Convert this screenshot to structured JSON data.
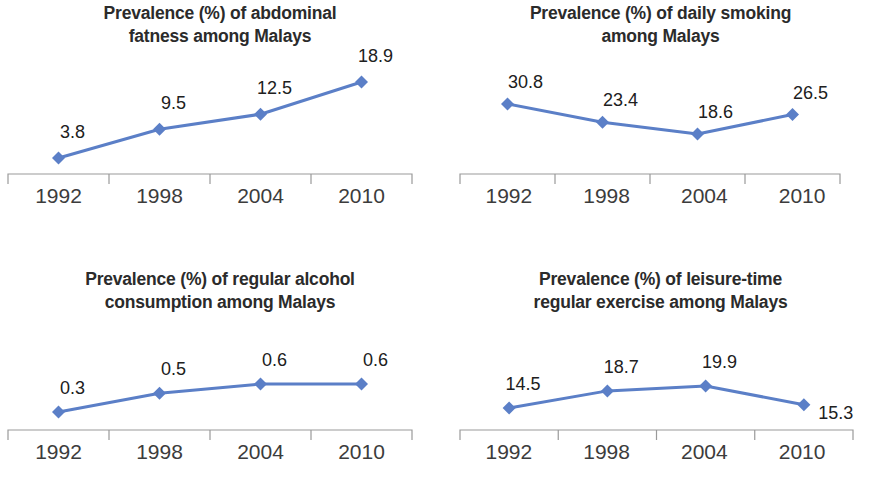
{
  "figure": {
    "background_color": "#ffffff",
    "series_color": "#5B7FC7",
    "axis_color": "#9a9a9a",
    "text_color": "#262626",
    "panel_count": 4
  },
  "chart_data": [
    {
      "type": "line",
      "title": "Prevalence (%) of abdominal\nfatness among Malays",
      "title_line1": "Prevalence (%) of abdominal",
      "title_line2": "fatness among Malays",
      "categories": [
        "1992",
        "1998",
        "2004",
        "2010"
      ],
      "values": [
        3.8,
        9.5,
        12.5,
        18.9
      ],
      "labels": [
        "3.8",
        "9.5",
        "12.5",
        "18.9"
      ],
      "xlabel": "",
      "ylabel": "",
      "ylim": [
        0,
        21
      ],
      "grid": false,
      "legend": "none",
      "marker": "diamond",
      "series_name": "Prevalence (%)"
    },
    {
      "type": "line",
      "title": "Prevalence (%) of daily smoking\namong Malays",
      "title_line1": "Prevalence (%) of daily smoking",
      "title_line2": "among Malays",
      "categories": [
        "1992",
        "1998",
        "2004",
        "2010"
      ],
      "values": [
        30.8,
        23.4,
        18.6,
        26.5
      ],
      "labels": [
        "30.8",
        "23.4",
        "18.6",
        "26.5"
      ],
      "xlabel": "",
      "ylabel": "",
      "ylim": [
        0,
        34
      ],
      "grid": false,
      "legend": "none",
      "marker": "diamond",
      "series_name": "Prevalence (%)"
    },
    {
      "type": "line",
      "title": "Prevalence (%) of regular alcohol\nconsumption among Malays",
      "title_line1": "Prevalence (%) of regular alcohol",
      "title_line2": "consumption among Malays",
      "categories": [
        "1992",
        "1998",
        "2004",
        "2010"
      ],
      "values": [
        0.3,
        0.5,
        0.6,
        0.6
      ],
      "labels": [
        "0.3",
        "0.5",
        "0.6",
        "0.6"
      ],
      "xlabel": "",
      "ylabel": "",
      "ylim": [
        0,
        0.75
      ],
      "grid": false,
      "legend": "none",
      "marker": "diamond",
      "series_name": "Prevalence (%)"
    },
    {
      "type": "line",
      "title": "Prevalence (%) of leisure-time\nregular exercise among Malays",
      "title_line1": "Prevalence (%) of leisure-time",
      "title_line2": "regular exercise among Malays",
      "categories": [
        "1992",
        "1998",
        "2004",
        "2010"
      ],
      "values": [
        14.5,
        18.7,
        19.9,
        15.3
      ],
      "labels": [
        "14.5",
        "18.7",
        "19.9",
        "15.3"
      ],
      "xlabel": "",
      "ylabel": "",
      "ylim": [
        0,
        24
      ],
      "grid": false,
      "legend": "none",
      "marker": "diamond",
      "series_name": "Prevalence (%)"
    }
  ]
}
